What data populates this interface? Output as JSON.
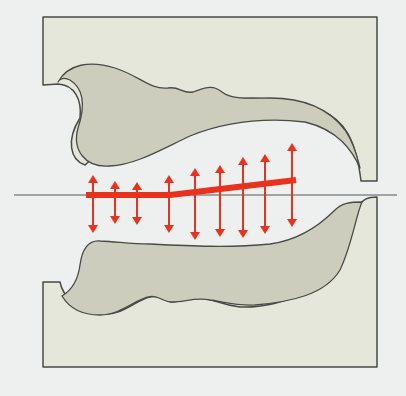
{
  "diagram": {
    "colors": {
      "background": "#eef0ef",
      "block_fill": "#e6e7db",
      "inclusion_fill": "#cdcdbd",
      "outline": "#4a4a46",
      "centerline": "#55585a",
      "red": "#e8321e"
    },
    "centerline": {
      "x1": 14,
      "x2": 397,
      "y": 195
    },
    "red_line": {
      "points": [
        [
          86,
          195
        ],
        [
          170,
          195
        ],
        [
          296,
          180
        ]
      ],
      "width": 6
    },
    "arrows": [
      {
        "x": 93,
        "top": 175,
        "bottom": 233
      },
      {
        "x": 115,
        "top": 181,
        "bottom": 224
      },
      {
        "x": 137,
        "top": 182,
        "bottom": 225
      },
      {
        "x": 169,
        "top": 175,
        "bottom": 233
      },
      {
        "x": 195,
        "top": 168,
        "bottom": 240
      },
      {
        "x": 220,
        "top": 165,
        "bottom": 237
      },
      {
        "x": 243,
        "top": 157,
        "bottom": 238
      },
      {
        "x": 265,
        "top": 154,
        "bottom": 234
      },
      {
        "x": 292,
        "top": 143,
        "bottom": 227
      }
    ]
  }
}
